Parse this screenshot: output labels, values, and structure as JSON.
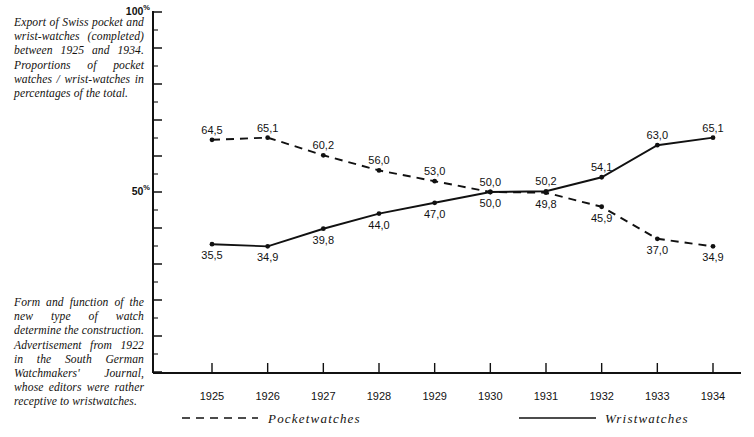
{
  "captions": {
    "top": "Export of Swiss pocket and wrist-watches (completed) between 1925 and 1934. Proportions of pocket watches / wrist-watches in percentages of the total.",
    "bottom": "Form and function of the new type of watch determine the construction. Advertisement from 1922 in the South German Watchmakers' Journal, whose editors were rather receptive to wristwatches."
  },
  "axis": {
    "y_top_label": "100",
    "y_top_unit": "%",
    "y_mid_label": "50",
    "y_mid_unit": "%"
  },
  "legend": {
    "pocketwatches": "Pocketwatches",
    "wristwatches": "Wristwatches"
  },
  "colors": {
    "ink": "#111111",
    "background": "#ffffff"
  },
  "chart_data": {
    "type": "line",
    "xlabel": "",
    "ylabel": "%",
    "ylim": [
      0,
      100
    ],
    "ytick_labels": [
      "50%",
      "100%"
    ],
    "ytick_values": [
      50,
      100
    ],
    "grid": false,
    "legend_position": "bottom",
    "decimal_separator": ",",
    "categories": [
      "1925",
      "1926",
      "1927",
      "1928",
      "1929",
      "1930",
      "1931",
      "1932",
      "1933",
      "1934"
    ],
    "x": [
      1925,
      1926,
      1927,
      1928,
      1929,
      1930,
      1931,
      1932,
      1933,
      1934
    ],
    "series": [
      {
        "name": "Pocketwatches",
        "style": "dashed",
        "values": [
          64.5,
          65.1,
          60.2,
          56.0,
          53.0,
          50.0,
          49.8,
          45.9,
          37.0,
          34.9
        ],
        "labels": [
          "64,5",
          "65,1",
          "60,2",
          "56,0",
          "53,0",
          "50,0",
          "49,8",
          "45,9",
          "37,0",
          "34,9"
        ],
        "label_side": [
          "above",
          "above",
          "above",
          "above",
          "above",
          "above",
          "below",
          "below",
          "below",
          "below"
        ]
      },
      {
        "name": "Wristwatches",
        "style": "solid",
        "values": [
          35.5,
          34.9,
          39.8,
          44.0,
          47.0,
          50.0,
          50.2,
          54.1,
          63.0,
          65.1
        ],
        "labels": [
          "35,5",
          "34,9",
          "39,8",
          "44,0",
          "47,0",
          "50,0",
          "50,2",
          "54,1",
          "63,0",
          "65,1"
        ],
        "label_side": [
          "below",
          "below",
          "below",
          "below",
          "below",
          "below",
          "above",
          "above",
          "above",
          "above"
        ]
      }
    ]
  }
}
